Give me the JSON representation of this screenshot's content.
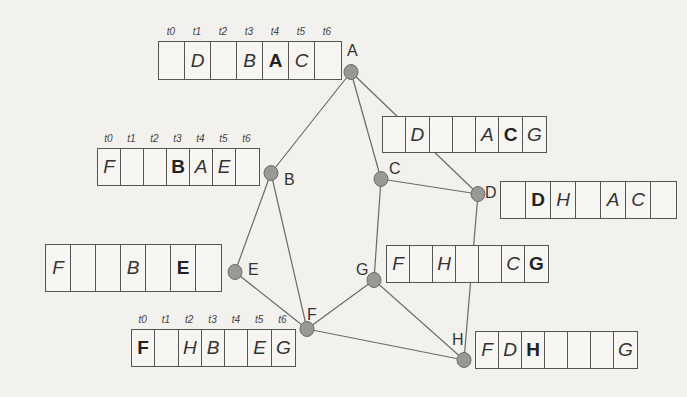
{
  "diagram": {
    "type": "graph-with-time-slot-tables",
    "time_labels": [
      "t0",
      "t1",
      "t2",
      "t3",
      "t4",
      "t5",
      "t6"
    ],
    "nodes": [
      {
        "id": "A",
        "x": 351,
        "y": 72,
        "label_x": 347,
        "label_y": 42
      },
      {
        "id": "B",
        "x": 271,
        "y": 173,
        "label_x": 284,
        "label_y": 171
      },
      {
        "id": "C",
        "x": 381,
        "y": 179,
        "label_x": 389,
        "label_y": 160
      },
      {
        "id": "D",
        "x": 478,
        "y": 194,
        "label_x": 485,
        "label_y": 184
      },
      {
        "id": "E",
        "x": 235,
        "y": 272,
        "label_x": 248,
        "label_y": 261
      },
      {
        "id": "F",
        "x": 307,
        "y": 329,
        "label_x": 307,
        "label_y": 306
      },
      {
        "id": "G",
        "x": 374,
        "y": 280,
        "label_x": 356,
        "label_y": 261
      },
      {
        "id": "H",
        "x": 464,
        "y": 360,
        "label_x": 452,
        "label_y": 331
      }
    ],
    "edges": [
      [
        "A",
        "B"
      ],
      [
        "A",
        "C"
      ],
      [
        "A",
        "D"
      ],
      [
        "C",
        "D"
      ],
      [
        "C",
        "G"
      ],
      [
        "B",
        "E"
      ],
      [
        "B",
        "F"
      ],
      [
        "E",
        "F"
      ],
      [
        "F",
        "G"
      ],
      [
        "F",
        "H"
      ],
      [
        "G",
        "H"
      ],
      [
        "D",
        "H"
      ]
    ],
    "tables": [
      {
        "node": "A",
        "x": 158,
        "y": 41,
        "cell_w": 26,
        "h": 39,
        "show_ticks": true,
        "cells": [
          {
            "text": "",
            "bold": false
          },
          {
            "text": "D",
            "bold": false
          },
          {
            "text": "",
            "bold": false
          },
          {
            "text": "B",
            "bold": false
          },
          {
            "text": "A",
            "bold": true
          },
          {
            "text": "C",
            "bold": false
          },
          {
            "text": "",
            "bold": false
          }
        ]
      },
      {
        "node": "B",
        "x": 97,
        "y": 148,
        "cell_w": 23,
        "h": 38,
        "show_ticks": true,
        "cells": [
          {
            "text": "F",
            "bold": false
          },
          {
            "text": "",
            "bold": false
          },
          {
            "text": "",
            "bold": false
          },
          {
            "text": "B",
            "bold": true
          },
          {
            "text": "A",
            "bold": false
          },
          {
            "text": "E",
            "bold": false
          },
          {
            "text": "",
            "bold": false
          }
        ]
      },
      {
        "node": "C",
        "x": 382,
        "y": 116,
        "cell_w": 23.3,
        "h": 37,
        "show_ticks": false,
        "cells": [
          {
            "text": "",
            "bold": false
          },
          {
            "text": "D",
            "bold": false
          },
          {
            "text": "",
            "bold": false
          },
          {
            "text": "",
            "bold": false
          },
          {
            "text": "A",
            "bold": false
          },
          {
            "text": "C",
            "bold": true
          },
          {
            "text": "G",
            "bold": false
          }
        ]
      },
      {
        "node": "D",
        "x": 500,
        "y": 181,
        "cell_w": 25,
        "h": 38,
        "show_ticks": false,
        "cells": [
          {
            "text": "",
            "bold": false
          },
          {
            "text": "D",
            "bold": true
          },
          {
            "text": "H",
            "bold": false
          },
          {
            "text": "",
            "bold": false
          },
          {
            "text": "A",
            "bold": false
          },
          {
            "text": "C",
            "bold": false
          },
          {
            "text": "",
            "bold": false
          }
        ]
      },
      {
        "node": "E",
        "x": 45,
        "y": 244,
        "cell_w": 25,
        "h": 48,
        "show_ticks": false,
        "cells": [
          {
            "text": "F",
            "bold": false
          },
          {
            "text": "",
            "bold": false
          },
          {
            "text": "",
            "bold": false
          },
          {
            "text": "B",
            "bold": false
          },
          {
            "text": "",
            "bold": false
          },
          {
            "text": "E",
            "bold": true
          },
          {
            "text": "",
            "bold": false
          }
        ]
      },
      {
        "node": "G",
        "x": 386,
        "y": 245,
        "cell_w": 23,
        "h": 38,
        "show_ticks": false,
        "cells": [
          {
            "text": "F",
            "bold": false
          },
          {
            "text": "",
            "bold": false
          },
          {
            "text": "H",
            "bold": false
          },
          {
            "text": "",
            "bold": false
          },
          {
            "text": "",
            "bold": false
          },
          {
            "text": "C",
            "bold": false
          },
          {
            "text": "G",
            "bold": true
          }
        ]
      },
      {
        "node": "F",
        "x": 131,
        "y": 329,
        "cell_w": 23.3,
        "h": 38,
        "show_ticks": true,
        "cells": [
          {
            "text": "F",
            "bold": true
          },
          {
            "text": "",
            "bold": false
          },
          {
            "text": "H",
            "bold": false
          },
          {
            "text": "B",
            "bold": false
          },
          {
            "text": "",
            "bold": false
          },
          {
            "text": "E",
            "bold": false
          },
          {
            "text": "G",
            "bold": false
          }
        ]
      },
      {
        "node": "H",
        "x": 475,
        "y": 331,
        "cell_w": 23,
        "h": 38,
        "show_ticks": false,
        "cells": [
          {
            "text": "F",
            "bold": false
          },
          {
            "text": "D",
            "bold": false
          },
          {
            "text": "H",
            "bold": true
          },
          {
            "text": "",
            "bold": false
          },
          {
            "text": "",
            "bold": false
          },
          {
            "text": "",
            "bold": false
          },
          {
            "text": "G",
            "bold": false
          }
        ]
      }
    ],
    "colors": {
      "node_fill": "#9a9894",
      "node_stroke": "#6e6c68",
      "edge": "#6a6a6a",
      "background": "#f2f1ee"
    }
  }
}
